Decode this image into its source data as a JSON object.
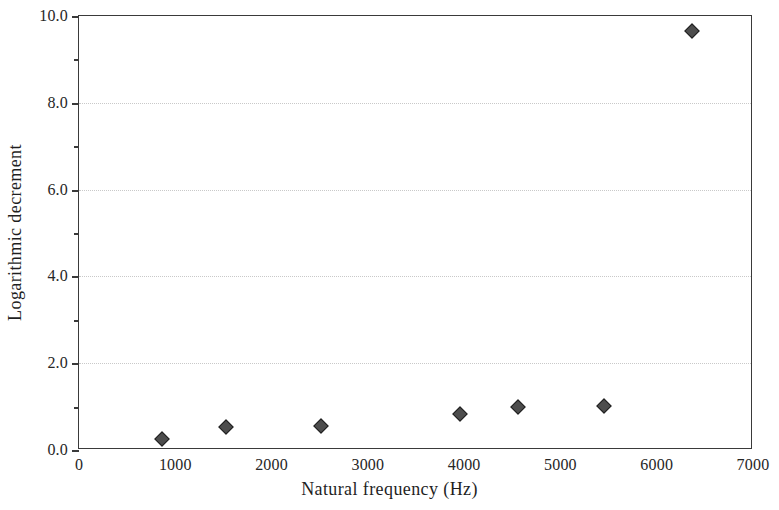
{
  "chart_data": {
    "type": "scatter",
    "title": "",
    "xlabel": "Natural frequency (Hz)",
    "ylabel": "Logarithmic decrement",
    "xlim": [
      0,
      7000
    ],
    "ylim": [
      0.0,
      10.0
    ],
    "grid": true,
    "legend": null,
    "marker_style": "filled diamond",
    "marker_color": "#4d4d4d",
    "x": [
      863,
      1529,
      2517,
      3953,
      4556,
      5450,
      6365
    ],
    "y": [
      0.25,
      0.52,
      0.55,
      0.82,
      1.0,
      1.02,
      9.65
    ],
    "points": [
      {
        "x": 863,
        "y": 0.25
      },
      {
        "x": 1529,
        "y": 0.52
      },
      {
        "x": 2517,
        "y": 0.55
      },
      {
        "x": 3953,
        "y": 0.82
      },
      {
        "x": 4556,
        "y": 1.0
      },
      {
        "x": 5450,
        "y": 1.02
      },
      {
        "x": 6365,
        "y": 9.65
      }
    ],
    "xticks": [
      0,
      1000,
      2000,
      3000,
      4000,
      5000,
      6000,
      7000
    ],
    "xtick_labels": [
      "0",
      "1000",
      "2000",
      "3000",
      "4000",
      "5000",
      "6000",
      "7000"
    ],
    "yticks": [
      0.0,
      2.0,
      4.0,
      6.0,
      8.0,
      10.0
    ],
    "ytick_labels": [
      "0.0",
      "2.0",
      "4.0",
      "6.0",
      "8.0",
      "10.0"
    ],
    "yticks_minor": [
      1.0,
      3.0,
      5.0,
      7.0,
      9.0
    ],
    "axis_color": "#3a3a3a",
    "grid_color": "#c9c9c9",
    "background_color": "#ffffff"
  }
}
